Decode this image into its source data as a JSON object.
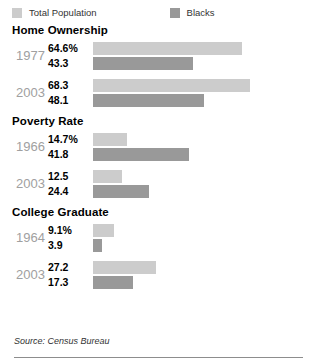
{
  "legend": {
    "items": [
      {
        "label": "Total Population",
        "color": "#cccccc",
        "key": "total"
      },
      {
        "label": "Blacks",
        "color": "#999999",
        "key": "blacks"
      }
    ]
  },
  "source": "Source: Census Bureau",
  "chart_data": {
    "type": "bar",
    "title": "",
    "orientation": "horizontal",
    "xlabel": "",
    "ylabel": "",
    "grid": false,
    "legend_position": "top-left",
    "unit": "percent",
    "axis_start_value": 0,
    "px_per_unit": 2.3,
    "series": [
      {
        "name": "Total Population",
        "color": "#cccccc"
      },
      {
        "name": "Blacks",
        "color": "#999999"
      }
    ],
    "sections": [
      {
        "title": "Home Ownership",
        "groups": [
          {
            "year": "1977",
            "bars": [
              {
                "series": "Total Population",
                "label": "64.6%",
                "value": 64.6
              },
              {
                "series": "Blacks",
                "label": "43.3",
                "value": 43.3
              }
            ]
          },
          {
            "year": "2003",
            "bars": [
              {
                "series": "Total Population",
                "label": "68.3",
                "value": 68.3
              },
              {
                "series": "Blacks",
                "label": "48.1",
                "value": 48.1
              }
            ]
          }
        ]
      },
      {
        "title": "Poverty Rate",
        "groups": [
          {
            "year": "1966",
            "bars": [
              {
                "series": "Total Population",
                "label": "14.7%",
                "value": 14.7
              },
              {
                "series": "Blacks",
                "label": "41.8",
                "value": 41.8
              }
            ]
          },
          {
            "year": "2003",
            "bars": [
              {
                "series": "Total Population",
                "label": "12.5",
                "value": 12.5
              },
              {
                "series": "Blacks",
                "label": "24.4",
                "value": 24.4
              }
            ]
          }
        ]
      },
      {
        "title": "College Graduate",
        "groups": [
          {
            "year": "1964",
            "bars": [
              {
                "series": "Total Population",
                "label": "9.1%",
                "value": 9.1
              },
              {
                "series": "Blacks",
                "label": "3.9",
                "value": 3.9
              }
            ]
          },
          {
            "year": "2003",
            "bars": [
              {
                "series": "Total Population",
                "label": "27.2",
                "value": 27.2
              },
              {
                "series": "Blacks",
                "label": "17.3",
                "value": 17.3
              }
            ]
          }
        ]
      }
    ]
  }
}
